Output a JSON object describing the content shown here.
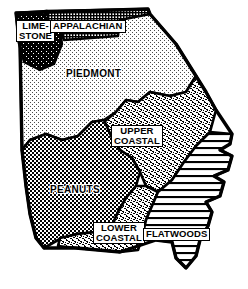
{
  "figure": {
    "kind": "thematic-region-map",
    "style": "black-and-white line art with hatch-pattern fills",
    "background_color": "#ffffff",
    "ink_color": "#000000"
  },
  "regions": [
    {
      "id": "limestone",
      "label": "LIME-\nSTONE",
      "label_line1": "LIME-",
      "label_line2": "STONE",
      "label_in_box": true,
      "pattern": "solid-dark-mottled",
      "fill_color": "#1a1a1a",
      "position": "northwest corner"
    },
    {
      "id": "appalachian",
      "label": "APPALACHIAN",
      "label_line1": "APPALACHIAN",
      "label_in_box": true,
      "pattern": "fine-cross-hatch-grid",
      "fill_color": "#3d3d3d",
      "position": "north"
    },
    {
      "id": "piedmont",
      "label": "PIEDMONT",
      "label_line1": "PIEDMONT",
      "label_in_box": false,
      "pattern": "sparse-stipple-dots",
      "fill_color": "#d8d8d8",
      "position": "north-central"
    },
    {
      "id": "upper-coastal",
      "label": "UPPER\nCOASTAL",
      "label_line1": "UPPER",
      "label_line2": "COASTAL",
      "label_in_box": true,
      "pattern": "dense-random-speckle",
      "fill_color": "#8a8a8a",
      "position": "central-east"
    },
    {
      "id": "peanuts",
      "label": "PEANUTS",
      "label_line1": "PEANUTS",
      "label_in_box": false,
      "pattern": "checkerboard-grid",
      "fill_color": "#9a9a9a",
      "position": "southwest"
    },
    {
      "id": "lower-coastal",
      "label": "LOWER\nCOASTAL",
      "label_line1": "LOWER",
      "label_line2": "COASTAL",
      "label_in_box": true,
      "pattern": "dense-random-speckle",
      "fill_color": "#8a8a8a",
      "position": "south-central"
    },
    {
      "id": "flatwoods",
      "label": "FLATWOODS",
      "label_line1": "FLATWOODS",
      "label_in_box": true,
      "pattern": "horizontal-line-hatch",
      "fill_color": "#ffffff",
      "position": "southeast coastal"
    }
  ]
}
